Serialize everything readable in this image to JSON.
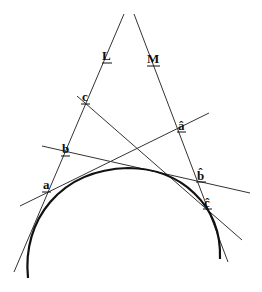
{
  "diagram": {
    "labels": {
      "L": "L",
      "M": "M",
      "a": "a",
      "b": "b",
      "c": "c",
      "a_hat": "â",
      "b_hat": "b̂",
      "c_hat": "ĉ"
    },
    "lines": [
      {
        "name": "line-L",
        "from": [
          124,
          14
        ],
        "to": [
          14,
          272
        ]
      },
      {
        "name": "line-M",
        "from": [
          134,
          14
        ],
        "to": [
          228,
          262
        ]
      },
      {
        "name": "tangent-c-chat",
        "from": [
          77,
          96
        ],
        "to": [
          242,
          240
        ]
      },
      {
        "name": "tangent-b-bhat",
        "from": [
          42,
          146
        ],
        "to": [
          250,
          193
        ]
      },
      {
        "name": "tangent-a-ahat",
        "from": [
          20,
          206
        ],
        "to": [
          209,
          113
        ]
      }
    ],
    "arc": {
      "center": [
        125,
        265
      ],
      "radius_x": 97,
      "radius_y": 97,
      "from": [
        28,
        278
      ],
      "to": [
        220,
        259
      ]
    },
    "colors": {
      "line": "#333333",
      "arc": "#111111",
      "background": "#ffffff"
    }
  }
}
